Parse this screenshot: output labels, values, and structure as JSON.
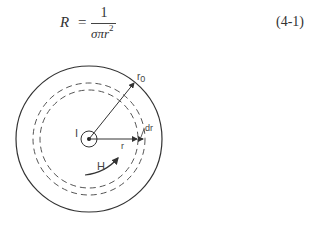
{
  "equation": {
    "lhs": "R",
    "equals": "=",
    "numerator": "1",
    "denominator": "σπr",
    "exponent": "2",
    "number": "(4-1)"
  },
  "figure": {
    "labels": {
      "current": "I",
      "outer_radius": "r",
      "outer_radius_sub": "0",
      "radius": "r",
      "shell_thickness": "dr",
      "field": "H"
    }
  }
}
